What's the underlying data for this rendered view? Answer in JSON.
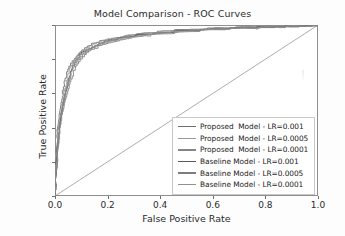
{
  "chart_data": {
    "type": "line",
    "title": "Model Comparison - ROC Curves",
    "xlabel": "False Positive Rate",
    "ylabel": "True Positive Rate",
    "xlim": [
      0.0,
      1.0
    ],
    "ylim": [
      0.0,
      1.0
    ],
    "grid": false,
    "legend_position": "lower right",
    "xticks": [
      "0.0",
      "0.2",
      "0.4",
      "0.6",
      "0.8",
      "1.0"
    ],
    "xtick_values": [
      0.0,
      0.2,
      0.4,
      0.6,
      0.8,
      1.0
    ],
    "yticks": [
      "0.0",
      "0.2",
      "0.4",
      "0.6",
      "0.8",
      "1.0"
    ],
    "ytick_values": [
      0.0,
      0.2,
      0.4,
      0.6,
      0.8,
      1.0
    ],
    "series": [
      {
        "name": "Proposed  Model - LR=0.001",
        "color": "#6e6e6e",
        "x": [
          0.0,
          0.005,
          0.01,
          0.015,
          0.02,
          0.03,
          0.04,
          0.05,
          0.06,
          0.08,
          0.1,
          0.12,
          0.14,
          0.17,
          0.2,
          0.25,
          0.3,
          0.35,
          0.4,
          0.5,
          0.6,
          0.7,
          0.8,
          0.9,
          1.0
        ],
        "y": [
          0.0,
          0.21,
          0.38,
          0.46,
          0.53,
          0.62,
          0.69,
          0.74,
          0.78,
          0.82,
          0.855,
          0.875,
          0.89,
          0.905,
          0.917,
          0.932,
          0.944,
          0.953,
          0.962,
          0.974,
          0.981,
          0.986,
          0.99,
          0.994,
          0.998
        ]
      },
      {
        "name": "Proposed  Model - LR=0.0005",
        "color": "#9a9a9a",
        "x": [
          0.0,
          0.005,
          0.01,
          0.018,
          0.025,
          0.035,
          0.045,
          0.055,
          0.07,
          0.09,
          0.11,
          0.13,
          0.16,
          0.19,
          0.23,
          0.28,
          0.33,
          0.4,
          0.48,
          0.56,
          0.66,
          0.76,
          0.86,
          0.94,
          1.0
        ],
        "y": [
          0.0,
          0.19,
          0.35,
          0.45,
          0.52,
          0.61,
          0.68,
          0.735,
          0.79,
          0.835,
          0.862,
          0.882,
          0.9,
          0.913,
          0.926,
          0.94,
          0.95,
          0.96,
          0.97,
          0.977,
          0.983,
          0.988,
          0.992,
          0.995,
          0.998
        ]
      },
      {
        "name": "Proposed  Model - LR=0.0001",
        "color": "#858585",
        "x": [
          0.0,
          0.004,
          0.012,
          0.02,
          0.028,
          0.038,
          0.05,
          0.062,
          0.075,
          0.095,
          0.115,
          0.14,
          0.165,
          0.2,
          0.24,
          0.29,
          0.35,
          0.42,
          0.5,
          0.58,
          0.68,
          0.78,
          0.88,
          0.95,
          1.0
        ],
        "y": [
          0.0,
          0.17,
          0.33,
          0.44,
          0.51,
          0.6,
          0.67,
          0.725,
          0.77,
          0.815,
          0.845,
          0.868,
          0.888,
          0.905,
          0.92,
          0.934,
          0.946,
          0.957,
          0.967,
          0.975,
          0.982,
          0.987,
          0.991,
          0.994,
          0.998
        ]
      },
      {
        "name": "Baseline Model - LR=0.001",
        "color": "#5a5a5a",
        "x": [
          0.0,
          0.006,
          0.013,
          0.022,
          0.03,
          0.042,
          0.053,
          0.065,
          0.08,
          0.1,
          0.125,
          0.15,
          0.18,
          0.215,
          0.26,
          0.31,
          0.37,
          0.45,
          0.53,
          0.62,
          0.71,
          0.8,
          0.89,
          0.95,
          1.0
        ],
        "y": [
          0.0,
          0.2,
          0.36,
          0.47,
          0.545,
          0.625,
          0.69,
          0.745,
          0.795,
          0.838,
          0.864,
          0.882,
          0.899,
          0.912,
          0.928,
          0.941,
          0.951,
          0.962,
          0.971,
          0.978,
          0.984,
          0.989,
          0.993,
          0.995,
          0.998
        ]
      },
      {
        "name": "Baseline Model - LR=0.0005",
        "color": "#7c7c7c",
        "x": [
          0.0,
          0.005,
          0.014,
          0.024,
          0.034,
          0.046,
          0.058,
          0.072,
          0.09,
          0.112,
          0.135,
          0.162,
          0.195,
          0.235,
          0.28,
          0.34,
          0.41,
          0.49,
          0.57,
          0.66,
          0.75,
          0.84,
          0.91,
          0.96,
          1.0
        ],
        "y": [
          0.0,
          0.175,
          0.34,
          0.455,
          0.53,
          0.615,
          0.682,
          0.738,
          0.788,
          0.828,
          0.857,
          0.876,
          0.895,
          0.91,
          0.925,
          0.938,
          0.949,
          0.96,
          0.969,
          0.977,
          0.983,
          0.988,
          0.992,
          0.995,
          0.998
        ]
      },
      {
        "name": "Baseline Model - LR=0.0001",
        "color": "#919191",
        "x": [
          0.0,
          0.004,
          0.011,
          0.019,
          0.027,
          0.037,
          0.048,
          0.06,
          0.073,
          0.092,
          0.113,
          0.138,
          0.168,
          0.205,
          0.25,
          0.3,
          0.36,
          0.43,
          0.52,
          0.61,
          0.7,
          0.79,
          0.88,
          0.94,
          1.0
        ],
        "y": [
          0.0,
          0.185,
          0.345,
          0.44,
          0.515,
          0.605,
          0.673,
          0.728,
          0.775,
          0.82,
          0.85,
          0.872,
          0.891,
          0.907,
          0.922,
          0.936,
          0.947,
          0.958,
          0.968,
          0.976,
          0.982,
          0.987,
          0.991,
          0.994,
          0.998
        ]
      }
    ],
    "reference_line": {
      "name": "chance-diagonal",
      "color": "#8a8a8a",
      "x": [
        0.0,
        1.0
      ],
      "y": [
        0.0,
        1.0
      ]
    }
  }
}
